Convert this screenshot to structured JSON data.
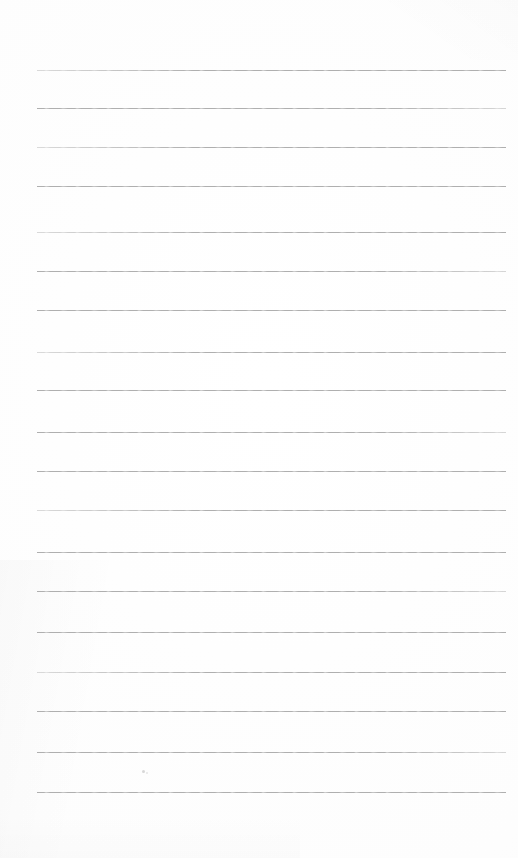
{
  "document": {
    "type": "lined-notepad-page",
    "title": "Blank ruled notebook page",
    "content_text": "",
    "page_width": 518,
    "page_height": 858,
    "background_color": "#fdfdfd",
    "is_blank": "true"
  },
  "ruling": {
    "line_color": "#a9a9a9",
    "line_thickness_px": 1,
    "line_count": 19,
    "left_margin_px": 37,
    "right_edge_px": 506,
    "line_length_px": 469,
    "first_line_y": 70,
    "last_line_y": 792,
    "line_spacing_px": 40.1,
    "lines": [
      {
        "index": 1,
        "y": 70,
        "fade": "faint-left"
      },
      {
        "index": 2,
        "y": 108,
        "fade": "faint-right"
      },
      {
        "index": 3,
        "y": 147,
        "fade": "faint-left"
      },
      {
        "index": 4,
        "y": 186,
        "fade": "none"
      },
      {
        "index": 5,
        "y": 232,
        "fade": "faint-left"
      },
      {
        "index": 6,
        "y": 271,
        "fade": "faint-right"
      },
      {
        "index": 7,
        "y": 310,
        "fade": "none"
      },
      {
        "index": 8,
        "y": 352,
        "fade": "faint-left"
      },
      {
        "index": 9,
        "y": 390,
        "fade": "none"
      },
      {
        "index": 10,
        "y": 432,
        "fade": "faint-right"
      },
      {
        "index": 11,
        "y": 471,
        "fade": "none"
      },
      {
        "index": 12,
        "y": 510,
        "fade": "faint-left"
      },
      {
        "index": 13,
        "y": 552,
        "fade": "none"
      },
      {
        "index": 14,
        "y": 591,
        "fade": "faint-right"
      },
      {
        "index": 15,
        "y": 632,
        "fade": "none"
      },
      {
        "index": 16,
        "y": 672,
        "fade": "faint-left"
      },
      {
        "index": 17,
        "y": 711,
        "fade": "none"
      },
      {
        "index": 18,
        "y": 752,
        "fade": "faint-right"
      },
      {
        "index": 19,
        "y": 792,
        "fade": "none"
      }
    ]
  },
  "artifacts": {
    "specks": [
      {
        "name": "speck-1",
        "x": 142,
        "y": 770,
        "color": "#c9c9c9"
      },
      {
        "name": "speck-2",
        "x": 146,
        "y": 772,
        "color": "#dcdcdc"
      }
    ],
    "shadow_note": "faint scanner shadow along lower-left edge"
  }
}
